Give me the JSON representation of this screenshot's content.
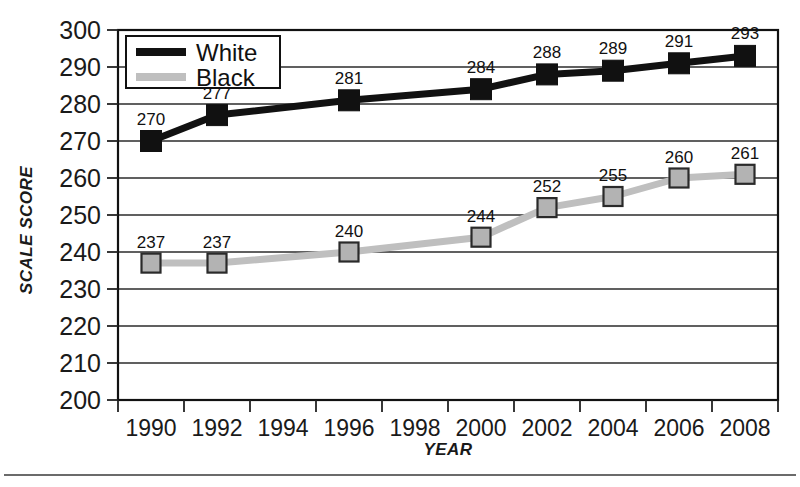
{
  "chart_data": {
    "type": "line",
    "title": "",
    "xlabel": "YEAR",
    "ylabel": "SCALE SCORE",
    "ylim": [
      200,
      300
    ],
    "xlim": [
      1989,
      2009
    ],
    "ytick_step": 10,
    "yticks": [
      200,
      210,
      220,
      230,
      240,
      250,
      260,
      270,
      280,
      290,
      300
    ],
    "xticks": [
      1990,
      1992,
      1994,
      1996,
      1998,
      2000,
      2002,
      2004,
      2006,
      2008
    ],
    "categories": [
      1990,
      1992,
      1996,
      2000,
      2002,
      2004,
      2006,
      2008
    ],
    "grid": true,
    "legend_position": "top-left",
    "series": [
      {
        "name": "White",
        "color": "#111111",
        "marker_fill": "#111111",
        "marker_edge": "#111111",
        "x": [
          1990,
          1992,
          1996,
          2000,
          2002,
          2004,
          2006,
          2008
        ],
        "values": [
          270,
          277,
          281,
          284,
          288,
          289,
          291,
          293
        ],
        "labels": [
          "270",
          "277",
          "281",
          "284",
          "288",
          "289",
          "291",
          "293"
        ]
      },
      {
        "name": "Black",
        "color": "#bfbfbf",
        "marker_fill": "#b3b3b3",
        "marker_edge": "#2a2a2a",
        "x": [
          1990,
          1992,
          1996,
          2000,
          2002,
          2004,
          2006,
          2008
        ],
        "values": [
          237,
          237,
          240,
          244,
          252,
          255,
          260,
          261
        ],
        "labels": [
          "237",
          "237",
          "240",
          "244",
          "252",
          "255",
          "260",
          "261"
        ]
      }
    ]
  },
  "axes": {
    "y_label_text": "SCALE SCORE",
    "x_label_text": "YEAR",
    "y_tick_labels": [
      "300",
      "290",
      "280",
      "270",
      "260",
      "250",
      "240",
      "230",
      "220",
      "210",
      "200"
    ],
    "x_tick_labels": [
      "1990",
      "1992",
      "1994",
      "1996",
      "1998",
      "2000",
      "2002",
      "2004",
      "2006",
      "2008"
    ]
  },
  "legend": {
    "entries": [
      {
        "label": "White",
        "swatch_color": "#111111"
      },
      {
        "label": "Black",
        "swatch_color": "#bfbfbf"
      }
    ]
  }
}
